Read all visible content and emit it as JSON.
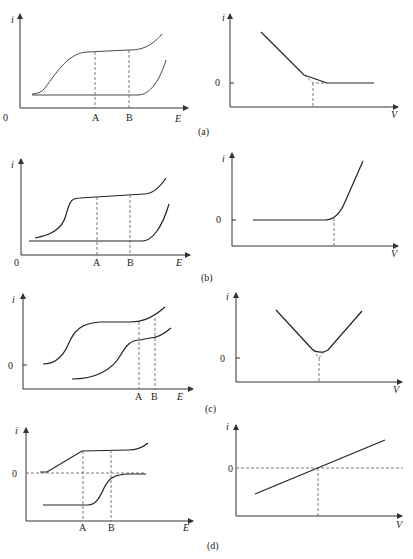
{
  "figure": {
    "panels": [
      {
        "id": "a",
        "caption": "(a)",
        "left": {
          "y_label": "i",
          "x_label": "E",
          "origin_label": "0",
          "markers": [
            "A",
            "B"
          ]
        },
        "right": {
          "y_label": "i",
          "x_label": "V",
          "zero_label": "0"
        }
      },
      {
        "id": "b",
        "caption": "(b)",
        "left": {
          "y_label": "i",
          "x_label": "E",
          "origin_label": "0",
          "markers": [
            "A",
            "B"
          ]
        },
        "right": {
          "y_label": "i",
          "x_label": "V",
          "zero_label": "0"
        }
      },
      {
        "id": "c",
        "caption": "(c)",
        "left": {
          "y_label": "i",
          "x_label": "E",
          "zero_label": "0",
          "markers": [
            "A",
            "B"
          ]
        },
        "right": {
          "y_label": "i",
          "x_label": "V",
          "zero_label": "0"
        }
      },
      {
        "id": "d",
        "caption": "(d)",
        "left": {
          "y_label": "i",
          "x_label": "E",
          "zero_label": "0",
          "markers": [
            "A",
            "B"
          ]
        },
        "right": {
          "y_label": "i",
          "x_label": "V",
          "zero_label": "0"
        }
      }
    ]
  }
}
